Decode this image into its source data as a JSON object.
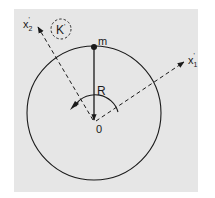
{
  "diagram": {
    "background_color": "#e6e6e6",
    "stroke_color": "#1a1a1a",
    "frame": {
      "x": 14,
      "y": 9,
      "width": 184,
      "height": 183
    },
    "circle": {
      "cx": 94,
      "cy": 113,
      "r": 67
    },
    "origin": {
      "x": 95,
      "y": 122,
      "label": "0"
    },
    "mass_point": {
      "x": 94,
      "y": 47,
      "label": "m"
    },
    "radius_vector": {
      "label": "R"
    },
    "axes": [
      {
        "id": "x1",
        "label": "x",
        "subscript": "1",
        "prime": "'",
        "tip": {
          "x": 184,
          "y": 62
        }
      },
      {
        "id": "x2",
        "label": "x",
        "subscript": "2",
        "prime": "'",
        "tip": {
          "x": 38,
          "y": 27
        }
      }
    ],
    "frame_badge": {
      "label": "K",
      "prime": "'",
      "cx": 61,
      "cy": 29,
      "r": 10
    },
    "rotation_arc": {
      "r": 24
    }
  }
}
